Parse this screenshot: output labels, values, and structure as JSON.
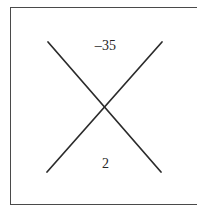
{
  "figure": {
    "kind": "x-factoring-diagram",
    "background_color": "#ffffff",
    "border_color": "#4a4a4a",
    "line_color": "#2b2b2b",
    "text_color": "#262626",
    "top_value": "–35",
    "bottom_value": "2",
    "left_value": "",
    "right_value": "",
    "lines": {
      "descending": {
        "x1": 48,
        "y1": 42,
        "x2": 161,
        "y2": 172
      },
      "ascending": {
        "x1": 162,
        "y1": 42,
        "x2": 47,
        "y2": 172
      },
      "intersection": {
        "x": 105,
        "y": 107
      }
    },
    "frame": {
      "x": 10,
      "y": 7,
      "width": 189,
      "height": 198
    }
  }
}
